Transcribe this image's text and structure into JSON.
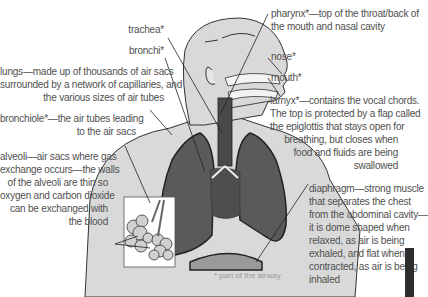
{
  "diagram": {
    "colors": {
      "body_fill": "#d9d9d9",
      "lung_fill": "#5a5a5a",
      "trachea_fill": "#4a4a4a",
      "diaphragm_fill": "#9a9a9a",
      "outline": "#333333",
      "label_text": "#505050"
    },
    "labels": {
      "trachea": [
        "trachea*"
      ],
      "bronchi": [
        "bronchi*"
      ],
      "lungs": [
        "lungs—made up of thousands of air sacs",
        "surrounded by a network of capillaries, and",
        "the various sizes of air tubes"
      ],
      "bronchiole": [
        "bronchiole*—the air tubes leading",
        "to the air sacs"
      ],
      "alveoli": [
        "alveoli—air sacs where gas",
        "exchange occurs—the walls",
        "of the alveoli are thin so",
        "oxygen and carbon dioxide",
        "can be exchanged with",
        "the blood"
      ],
      "pharynx": [
        "pharynx*—top of the throat/back of",
        "the mouth and nasal cavity"
      ],
      "nose": [
        "nose*"
      ],
      "mouth": [
        "mouth*"
      ],
      "larynx": [
        "larnyx*—contains the vocal chords.",
        "The top is protected by a flap called",
        "the epiglottis that stays open for",
        "breathing, but closes when",
        "food and fluids are being",
        "swallowed"
      ],
      "diaphragm": [
        "diaphragm—strong muscle",
        "that separates the chest",
        "from the abdominal cavity—",
        "it is dome shaped when",
        "relaxed, as air is being",
        "exhaled, and flat when",
        "contracted, as air is being",
        "inhaled"
      ]
    },
    "footnote": "* part of the airway"
  }
}
